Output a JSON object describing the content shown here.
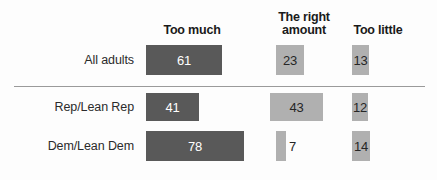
{
  "chart_data": {
    "type": "bar",
    "orientation": "horizontal",
    "title": "",
    "subtitle": "",
    "xlabel": "",
    "ylabel": "",
    "grid": false,
    "legend_position": "top",
    "categories": [
      "All adults",
      "Rep/Lean Rep",
      "Dem/Lean Dem"
    ],
    "series": [
      {
        "name": "Too much",
        "values": [
          61,
          41,
          78
        ]
      },
      {
        "name": "The right amount",
        "values": [
          23,
          43,
          7
        ]
      },
      {
        "name": "Too little",
        "values": [
          12,
          12,
          14
        ]
      }
    ],
    "values_display": [
      [
        "61",
        "23",
        "13"
      ],
      [
        "41",
        "43",
        "12"
      ],
      [
        "78",
        "7",
        "14"
      ]
    ]
  },
  "colors": {
    "bar_dark": "#595959",
    "bar_light": "#b0b0b0",
    "value_on_dark": "#ffffff",
    "value_on_light": "#262626",
    "divider": "#9a9a9a",
    "header_text": "#1a1a1a",
    "label_text": "#2b2b2b",
    "background": "#fdfdfd"
  },
  "headers": {
    "too_much": "Too much",
    "right_amount_line1": "The right",
    "right_amount_line2": "amount",
    "too_little": "Too little"
  },
  "rows": [
    {
      "label": "All adults",
      "bars": [
        {
          "value": "61",
          "tone": "dark",
          "left": 146,
          "width": 76,
          "height": 30,
          "label_outside": false
        },
        {
          "value": "23",
          "tone": "light",
          "left": 276,
          "width": 28,
          "height": 30,
          "label_outside": false
        },
        {
          "value": "13",
          "tone": "light",
          "left": 352,
          "width": 17,
          "height": 30,
          "label_outside": false
        }
      ]
    },
    {
      "label": "Rep/Lean Rep",
      "bars": [
        {
          "value": "41",
          "tone": "dark",
          "left": 146,
          "width": 53,
          "height": 28,
          "label_outside": false
        },
        {
          "value": "43",
          "tone": "light",
          "left": 270,
          "width": 53,
          "height": 28,
          "label_outside": false
        },
        {
          "value": "12",
          "tone": "light",
          "left": 352,
          "width": 16,
          "height": 28,
          "label_outside": false
        }
      ]
    },
    {
      "label": "Dem/Lean Dem",
      "bars": [
        {
          "value": "78",
          "tone": "dark",
          "left": 146,
          "width": 98,
          "height": 30,
          "label_outside": false
        },
        {
          "value": "7",
          "tone": "light",
          "left": 276,
          "width": 10,
          "height": 30,
          "label_outside": true
        },
        {
          "value": "14",
          "tone": "light",
          "left": 352,
          "width": 18,
          "height": 30,
          "label_outside": false
        }
      ]
    }
  ]
}
